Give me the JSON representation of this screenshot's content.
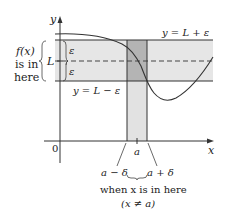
{
  "diagram": {
    "type": "epsilon-delta limit definition",
    "axes": {
      "y_label": "y",
      "x_label": "x",
      "origin_label": "0"
    },
    "band": {
      "upper_label": "y = L + ε",
      "lower_label": "y = L − ε",
      "center_label": "L",
      "epsilon_top": "ε",
      "epsilon_bottom": "ε"
    },
    "left_note": {
      "line1": "f(x)",
      "line2": "is in",
      "line3": "here"
    },
    "strip": {
      "left_label": "a − δ",
      "center_label": "a",
      "right_label": "a + δ"
    },
    "bottom_note": {
      "line1": "when x is in here",
      "line2": "(x ≠ a)"
    },
    "colors": {
      "band_fill": "#e6e6e6",
      "strip_fill": "#e0e0e0",
      "overlap_fill": "#b4b4b4",
      "line": "#333333"
    }
  }
}
